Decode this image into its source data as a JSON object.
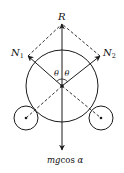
{
  "diagram": {
    "type": "force-diagram",
    "colors": {
      "stroke": "#1a1a1a",
      "background": "#ffffff"
    },
    "labels": {
      "R": "R",
      "N1_main": "N",
      "N1_sub": "1",
      "N2_main": "N",
      "N2_sub": "2",
      "theta_left": "θ",
      "theta_right": "θ",
      "weight_main": "mg",
      "weight_rest": "cos ",
      "weight_alpha": "α"
    },
    "vectors": [
      {
        "name": "R",
        "direction": "up"
      },
      {
        "name": "N1",
        "direction": "up-left"
      },
      {
        "name": "N2",
        "direction": "up-right"
      },
      {
        "name": "mgcos α",
        "direction": "down"
      }
    ],
    "circles": [
      {
        "name": "large-cylinder"
      },
      {
        "name": "left-support"
      },
      {
        "name": "right-support"
      }
    ]
  }
}
